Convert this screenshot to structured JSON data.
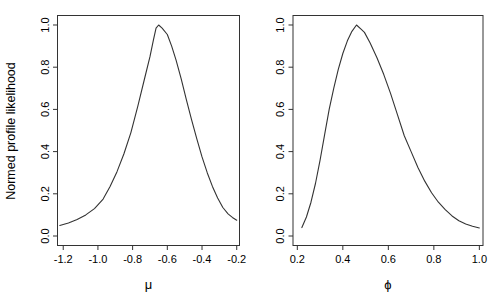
{
  "figure": {
    "background": "#ffffff",
    "axis_color": "#333333",
    "curve_color": "#333333",
    "text_color": "#000000"
  },
  "chart_data": [
    {
      "type": "line",
      "title": "",
      "xlabel": "μ",
      "ylabel": "Normed profile likelihood",
      "xlim": [
        -1.233,
        -0.184
      ],
      "ylim": [
        -0.045,
        1.045
      ],
      "grid": false,
      "legend": null,
      "x_ticks": [
        -1.2,
        -1.0,
        -0.8,
        -0.6,
        -0.4,
        -0.2
      ],
      "x_tick_labels": [
        "-1.2",
        "-1.0",
        "-0.8",
        "-0.6",
        "-0.4",
        "-0.2"
      ],
      "y_ticks": [
        0.0,
        0.2,
        0.4,
        0.6,
        0.8,
        1.0
      ],
      "y_tick_labels": [
        "0.0",
        "0.2",
        "0.4",
        "0.6",
        "0.8",
        "1.0"
      ],
      "series": [
        {
          "name": "normed-profile-likelihood-mu",
          "points": [
            [
              -1.22,
              0.05
            ],
            [
              -1.17,
              0.062
            ],
            [
              -1.12,
              0.078
            ],
            [
              -1.07,
              0.1
            ],
            [
              -1.02,
              0.13
            ],
            [
              -0.97,
              0.175
            ],
            [
              -0.93,
              0.235
            ],
            [
              -0.89,
              0.305
            ],
            [
              -0.85,
              0.39
            ],
            [
              -0.81,
              0.49
            ],
            [
              -0.77,
              0.615
            ],
            [
              -0.73,
              0.75
            ],
            [
              -0.7,
              0.85
            ],
            [
              -0.68,
              0.93
            ],
            [
              -0.665,
              0.985
            ],
            [
              -0.65,
              1.0
            ],
            [
              -0.63,
              0.985
            ],
            [
              -0.6,
              0.955
            ],
            [
              -0.575,
              0.9
            ],
            [
              -0.55,
              0.835
            ],
            [
              -0.52,
              0.745
            ],
            [
              -0.49,
              0.645
            ],
            [
              -0.46,
              0.55
            ],
            [
              -0.43,
              0.46
            ],
            [
              -0.4,
              0.375
            ],
            [
              -0.37,
              0.3
            ],
            [
              -0.34,
              0.235
            ],
            [
              -0.31,
              0.18
            ],
            [
              -0.28,
              0.135
            ],
            [
              -0.25,
              0.105
            ],
            [
              -0.225,
              0.088
            ],
            [
              -0.2,
              0.075
            ]
          ]
        }
      ]
    },
    {
      "type": "line",
      "title": "",
      "xlabel": "ϕ",
      "ylabel": "",
      "xlim": [
        0.181,
        1.016
      ],
      "ylim": [
        -0.045,
        1.045
      ],
      "grid": false,
      "legend": null,
      "x_ticks": [
        0.2,
        0.4,
        0.6,
        0.8,
        1.0
      ],
      "x_tick_labels": [
        "0.2",
        "0.4",
        "0.6",
        "0.8",
        "1.0"
      ],
      "y_ticks": [
        0.0,
        0.2,
        0.4,
        0.6,
        0.8,
        1.0
      ],
      "y_tick_labels": [
        "0.0",
        "0.2",
        "0.4",
        "0.6",
        "0.8",
        "1.0"
      ],
      "series": [
        {
          "name": "normed-profile-likelihood-phi",
          "points": [
            [
              0.22,
              0.04
            ],
            [
              0.24,
              0.09
            ],
            [
              0.26,
              0.16
            ],
            [
              0.28,
              0.25
            ],
            [
              0.3,
              0.36
            ],
            [
              0.32,
              0.48
            ],
            [
              0.34,
              0.6
            ],
            [
              0.36,
              0.7
            ],
            [
              0.38,
              0.79
            ],
            [
              0.4,
              0.865
            ],
            [
              0.42,
              0.925
            ],
            [
              0.44,
              0.97
            ],
            [
              0.46,
              1.0
            ],
            [
              0.48,
              0.98
            ],
            [
              0.495,
              0.965
            ],
            [
              0.52,
              0.915
            ],
            [
              0.55,
              0.845
            ],
            [
              0.58,
              0.765
            ],
            [
              0.61,
              0.675
            ],
            [
              0.64,
              0.575
            ],
            [
              0.67,
              0.475
            ],
            [
              0.7,
              0.4
            ],
            [
              0.73,
              0.325
            ],
            [
              0.76,
              0.26
            ],
            [
              0.79,
              0.205
            ],
            [
              0.82,
              0.16
            ],
            [
              0.85,
              0.125
            ],
            [
              0.88,
              0.095
            ],
            [
              0.91,
              0.072
            ],
            [
              0.94,
              0.057
            ],
            [
              0.97,
              0.046
            ],
            [
              1.0,
              0.038
            ]
          ]
        }
      ]
    }
  ]
}
